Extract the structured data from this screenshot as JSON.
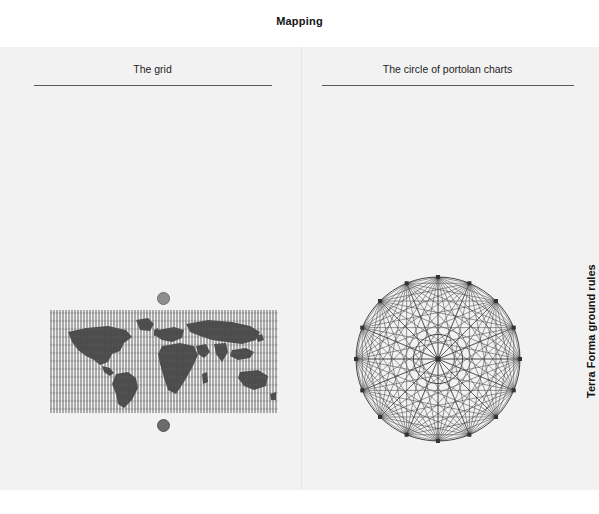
{
  "figure": {
    "title": "Mapping"
  },
  "side_labels": {
    "left": "Snark",
    "right": "Terra Forma ground rules"
  },
  "columns": [
    {
      "heading": "The grid",
      "graphic": "world-map-graticule",
      "annotations": {
        "north_pole_marker": "north-pole-dot",
        "south_pole_marker": "south-pole-dot"
      }
    },
    {
      "heading": "The circle of portolan charts",
      "graphic": "portolan-wind-rose",
      "annotations": {
        "nodes": 16,
        "center_node": "center-point"
      }
    }
  ],
  "colors": {
    "panel_background": "#f2f2f2",
    "page_background": "#ffffff",
    "rule": "#5a5a5a",
    "ink": "#333333",
    "north_pole_dot": "#8e8e8e",
    "south_pole_dot": "#6b6b6b",
    "map_land": "#4a4a4a",
    "map_graticule": "#555555"
  }
}
